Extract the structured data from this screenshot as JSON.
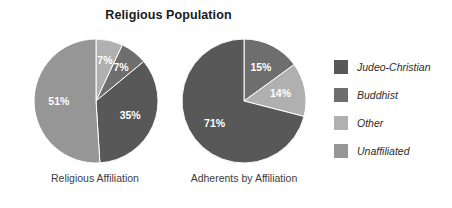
{
  "chart_data": {
    "type": "pie",
    "title": "Religious Population",
    "legend_position": "right",
    "legend": [
      {
        "label": "Judeo-Christian",
        "color": "#585858"
      },
      {
        "label": "Buddhist",
        "color": "#6e6e6e"
      },
      {
        "label": "Other",
        "color": "#b0b0b0"
      },
      {
        "label": "Unaffiliated",
        "color": "#969696"
      }
    ],
    "charts": [
      {
        "name": "religious-affiliation",
        "caption": "Religious Affiliation",
        "cx": 95,
        "cy": 100,
        "r": 62,
        "slices": [
          {
            "category": "Other",
            "value": 7,
            "label": "7%",
            "color": "#b0b0b0"
          },
          {
            "category": "Buddhist",
            "value": 7,
            "label": "7%",
            "color": "#6e6e6e"
          },
          {
            "category": "Judeo-Christian",
            "value": 35,
            "label": "35%",
            "color": "#585858"
          },
          {
            "category": "Unaffiliated",
            "value": 51,
            "label": "51%",
            "color": "#969696"
          }
        ]
      },
      {
        "name": "adherents-by-affiliation",
        "caption": "Adherents by Affiliation",
        "cx": 243,
        "cy": 100,
        "r": 62,
        "slices": [
          {
            "category": "Buddhist",
            "value": 15,
            "label": "15%",
            "color": "#6e6e6e"
          },
          {
            "category": "Other",
            "value": 14,
            "label": "14%",
            "color": "#b0b0b0"
          },
          {
            "category": "Judeo-Christian",
            "value": 71,
            "label": "71%",
            "color": "#585858"
          }
        ]
      }
    ]
  }
}
